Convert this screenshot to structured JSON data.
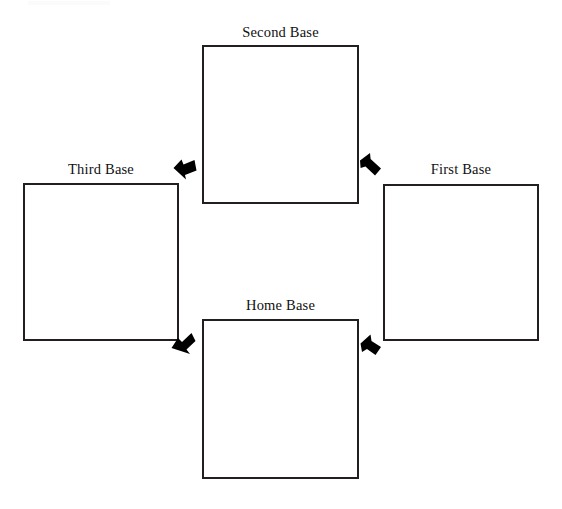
{
  "diagram": {
    "type": "cycle-diagram",
    "background_color": "#ffffff",
    "line_color": "#231f20",
    "arrow_color": "#000000",
    "bases": [
      {
        "id": "second",
        "label": "Second Base",
        "position": "top",
        "box_content": ""
      },
      {
        "id": "third",
        "label": "Third Base",
        "position": "left",
        "box_content": ""
      },
      {
        "id": "first",
        "label": "First Base",
        "position": "right",
        "box_content": ""
      },
      {
        "id": "home",
        "label": "Home Base",
        "position": "bottom",
        "box_content": ""
      }
    ],
    "connectors": [
      {
        "id": "home-to-first",
        "icon": "arrow-up-left-icon",
        "from": "Home Base",
        "to": "First Base",
        "direction": "up-left"
      },
      {
        "id": "first-to-second",
        "icon": "arrow-up-left-icon",
        "from": "First Base",
        "to": "Second Base",
        "direction": "up-left"
      },
      {
        "id": "second-to-third",
        "icon": "arrow-down-left-icon",
        "from": "Second Base",
        "to": "Third Base",
        "direction": "left"
      },
      {
        "id": "third-to-home",
        "icon": "arrow-down-left-icon",
        "from": "Third Base",
        "to": "Home Base",
        "direction": "down-left"
      }
    ]
  }
}
